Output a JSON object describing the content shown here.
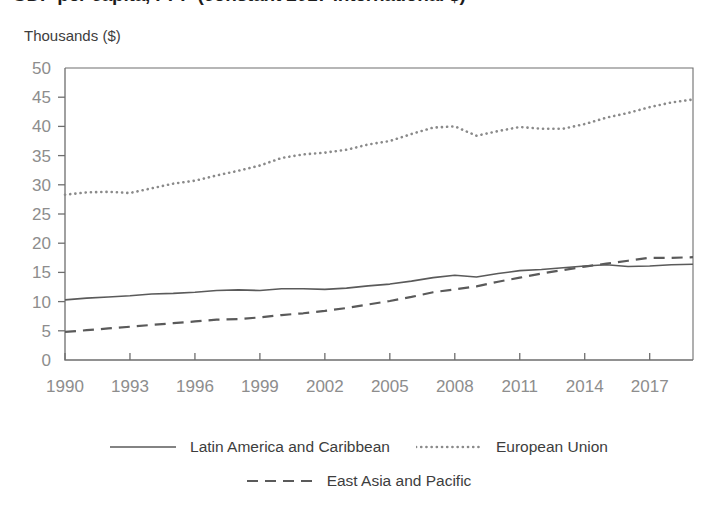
{
  "chart_data": {
    "type": "line",
    "title": "GDP per capita, PPP (constant 2017 international $)",
    "subtitle": "",
    "unit_label": "Thousands ($)",
    "xlabel": "",
    "ylabel": "Thousands ($)",
    "xlim": [
      1990,
      2019
    ],
    "ylim": [
      0,
      50
    ],
    "ytick_step": 5,
    "yticks": [
      0,
      5,
      10,
      15,
      20,
      25,
      30,
      35,
      40,
      45,
      50
    ],
    "ytick_labels": [
      "0",
      "5",
      "10",
      "15",
      "20",
      "25",
      "30",
      "35",
      "40",
      "45",
      "50"
    ],
    "xticks": [
      1990,
      1993,
      1996,
      1999,
      2002,
      2005,
      2008,
      2011,
      2014,
      2017
    ],
    "xtick_labels": [
      "1990",
      "1993",
      "1996",
      "1999",
      "2002",
      "2005",
      "2008",
      "2011",
      "2014",
      "2017"
    ],
    "grid": false,
    "legend_position": "bottom",
    "x": [
      1990,
      1991,
      1992,
      1993,
      1994,
      1995,
      1996,
      1997,
      1998,
      1999,
      2000,
      2001,
      2002,
      2003,
      2004,
      2005,
      2006,
      2007,
      2008,
      2009,
      2010,
      2011,
      2012,
      2013,
      2014,
      2015,
      2016,
      2017,
      2018,
      2019
    ],
    "series": [
      {
        "name": "Latin America and Caribbean",
        "style": "solid",
        "color": "#5a5a5a",
        "values": [
          10.3,
          10.6,
          10.8,
          11.0,
          11.3,
          11.4,
          11.6,
          11.9,
          12.0,
          11.9,
          12.2,
          12.2,
          12.1,
          12.3,
          12.7,
          13.0,
          13.5,
          14.1,
          14.5,
          14.2,
          14.8,
          15.3,
          15.5,
          15.8,
          16.1,
          16.3,
          16.0,
          16.1,
          16.3,
          16.4
        ]
      },
      {
        "name": "European Union",
        "style": "dotted",
        "color": "#8a8a8a",
        "values": [
          28.3,
          28.7,
          28.8,
          28.6,
          29.4,
          30.2,
          30.7,
          31.6,
          32.4,
          33.3,
          34.6,
          35.2,
          35.5,
          36.0,
          36.9,
          37.5,
          38.7,
          39.8,
          40.0,
          38.4,
          39.2,
          39.9,
          39.6,
          39.6,
          40.4,
          41.5,
          42.3,
          43.3,
          44.1,
          44.6
        ]
      },
      {
        "name": "East Asia and Pacific",
        "style": "dashed",
        "color": "#5a5a5a",
        "values": [
          4.8,
          5.1,
          5.4,
          5.7,
          6.0,
          6.3,
          6.6,
          6.9,
          7.0,
          7.3,
          7.7,
          8.0,
          8.4,
          8.9,
          9.5,
          10.1,
          10.8,
          11.6,
          12.1,
          12.6,
          13.4,
          14.1,
          14.8,
          15.4,
          16.0,
          16.5,
          17.0,
          17.5,
          17.5,
          17.6
        ]
      }
    ]
  },
  "legend": {
    "rows": [
      [
        {
          "label": "Latin America and Caribbean",
          "style": "solid"
        },
        {
          "label": "European Union",
          "style": "dotted"
        }
      ],
      [
        {
          "label": "East Asia and Pacific",
          "style": "dashed"
        }
      ]
    ]
  },
  "colors": {
    "axis": "#6e6e6e",
    "tick_text": "#8d8d8d",
    "label_text": "#3d3d3d",
    "background": "#ffffff"
  }
}
